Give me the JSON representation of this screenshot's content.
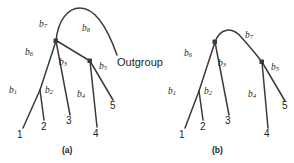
{
  "figure": {
    "stroke_color": "#3b3b3d",
    "node_color": "#3b3b3d",
    "background": "#ffffff",
    "panels": [
      {
        "id": "a",
        "caption": "(a)",
        "branch_labels": [
          {
            "name": "b1",
            "base": "b",
            "sub": "1"
          },
          {
            "name": "b2",
            "base": "b",
            "sub": "2"
          },
          {
            "name": "b3",
            "base": "b",
            "sub": "3"
          },
          {
            "name": "b4",
            "base": "b",
            "sub": "4"
          },
          {
            "name": "b5",
            "base": "b",
            "sub": "5"
          },
          {
            "name": "b6",
            "base": "b",
            "sub": "6"
          },
          {
            "name": "b7",
            "base": "b",
            "sub": "7"
          },
          {
            "name": "b8",
            "base": "b",
            "sub": "8"
          }
        ],
        "taxa": [
          "1",
          "2",
          "3",
          "4",
          "5"
        ],
        "outgroup_label": "Outgroup"
      },
      {
        "id": "b",
        "caption": "(b)",
        "branch_labels": [
          {
            "name": "b1",
            "base": "b",
            "sub": "1"
          },
          {
            "name": "b2",
            "base": "b",
            "sub": "2"
          },
          {
            "name": "b3",
            "base": "b",
            "sub": "3"
          },
          {
            "name": "b4",
            "base": "b",
            "sub": "4"
          },
          {
            "name": "b5",
            "base": "b",
            "sub": "5"
          },
          {
            "name": "b6",
            "base": "b",
            "sub": "6"
          },
          {
            "name": "b7",
            "base": "b",
            "sub": "7"
          }
        ],
        "taxa": [
          "1",
          "2",
          "3",
          "4",
          "5"
        ]
      }
    ]
  }
}
